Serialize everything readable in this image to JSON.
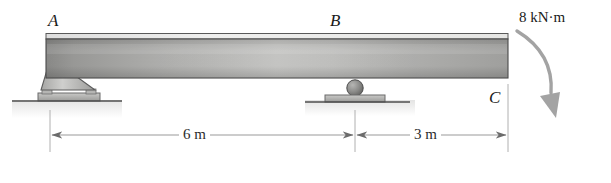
{
  "figure": {
    "type": "statics-beam-free-body-diagram",
    "width": 611,
    "height": 183,
    "background": "#ffffff"
  },
  "labels": {
    "point_a": "A",
    "point_b": "B",
    "point_c": "C"
  },
  "load": {
    "moment_label": "8 kN·m",
    "moment_sense": "clockwise",
    "applied_at": "C"
  },
  "dimensions": [
    {
      "label": "6 m",
      "from": "A",
      "to": "B"
    },
    {
      "label": "3 m",
      "from": "B",
      "to": "C"
    }
  ],
  "supports": [
    {
      "at": "A",
      "kind": "pin-support"
    },
    {
      "at": "B",
      "kind": "roller-support"
    }
  ],
  "colors": {
    "beam_edge": "#4a4a4a",
    "beam_light": "#e8e8e6",
    "beam_dark": "#8d8d8b",
    "support_fill": "#b9b9b7",
    "support_edge": "#5b5b5b",
    "ground_line": "#4f4f4f",
    "dimension_line": "#9a9a9a",
    "arrow_gray": "#a0a0a0",
    "text": "#1a1a1a"
  }
}
